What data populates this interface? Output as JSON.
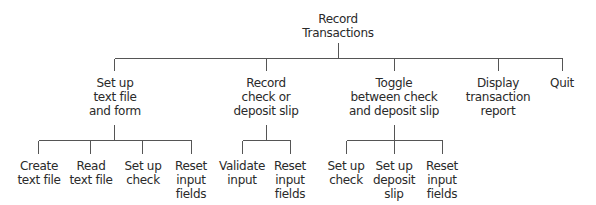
{
  "diagram": {
    "type": "hierarchy-chart",
    "root": {
      "label": [
        "Record",
        "Transactions"
      ],
      "x": 338,
      "y": 12
    },
    "level1": [
      {
        "label": [
          "Set up",
          "text file",
          "and form"
        ],
        "x": 115,
        "y": 76
      },
      {
        "label": [
          "Record",
          "check or",
          "deposit slip"
        ],
        "x": 266,
        "y": 76
      },
      {
        "label": [
          "Toggle",
          "between check",
          "and deposit slip"
        ],
        "x": 394,
        "y": 76
      },
      {
        "label": [
          "Display",
          "transaction",
          "report"
        ],
        "x": 498,
        "y": 76
      },
      {
        "label": [
          "Quit"
        ],
        "x": 562,
        "y": 76
      }
    ],
    "level2": [
      {
        "parent": 0,
        "label": [
          "Create",
          "text file"
        ],
        "x": 39,
        "y": 159
      },
      {
        "parent": 0,
        "label": [
          "Read",
          "text file"
        ],
        "x": 91,
        "y": 159
      },
      {
        "parent": 0,
        "label": [
          "Set up",
          "check"
        ],
        "x": 143,
        "y": 159
      },
      {
        "parent": 0,
        "label": [
          "Reset",
          "input",
          "fields"
        ],
        "x": 191,
        "y": 159
      },
      {
        "parent": 1,
        "label": [
          "Validate",
          "input"
        ],
        "x": 242,
        "y": 159
      },
      {
        "parent": 1,
        "label": [
          "Reset",
          "input",
          "fields"
        ],
        "x": 290,
        "y": 159
      },
      {
        "parent": 2,
        "label": [
          "Set up",
          "check"
        ],
        "x": 346,
        "y": 159
      },
      {
        "parent": 2,
        "label": [
          "Set up",
          "deposit",
          "slip"
        ],
        "x": 394,
        "y": 159
      },
      {
        "parent": 2,
        "label": [
          "Reset",
          "input",
          "fields"
        ],
        "x": 442,
        "y": 159
      }
    ],
    "line_color": "#555555",
    "text_color": "#2a2a2a"
  }
}
